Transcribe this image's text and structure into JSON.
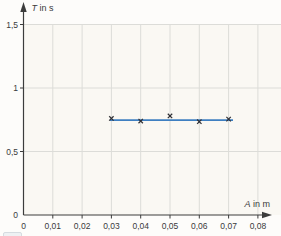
{
  "colors": {
    "background": "#fdfcfa",
    "plot_fill": "#faf8f3",
    "grid": "#dcdcd8",
    "axis": "#3c3c3c",
    "text": "#3a3a3a",
    "marker": "#2e2e33",
    "fit_line": "#3e7fc1",
    "corner_element_fill": "#eef1f3",
    "corner_element_border": "#d5dbe0"
  },
  "chart_data": {
    "type": "scatter",
    "title": "",
    "xlabel": "A in m",
    "ylabel": "T in s",
    "x_axis": {
      "symbol": "A",
      "unit_text": " in m",
      "tick_labels": [
        "0",
        "0,01",
        "0,02",
        "0,03",
        "0,04",
        "0,05",
        "0,06",
        "0,07",
        "0,08"
      ],
      "tick_values": [
        0,
        0.01,
        0.02,
        0.03,
        0.04,
        0.05,
        0.06,
        0.07,
        0.08
      ],
      "range": [
        0,
        0.088
      ],
      "decimal_separator": ","
    },
    "y_axis": {
      "symbol": "T",
      "unit_text": " in s",
      "tick_labels": [
        "0",
        "0,5",
        "1",
        "1,5"
      ],
      "tick_values": [
        0,
        0.5,
        1,
        1.5
      ],
      "range": [
        0,
        1.68
      ],
      "decimal_separator": ","
    },
    "grid": true,
    "marker": "x",
    "points": [
      {
        "x": 0.03,
        "y": 0.76
      },
      {
        "x": 0.04,
        "y": 0.74
      },
      {
        "x": 0.05,
        "y": 0.78
      },
      {
        "x": 0.06,
        "y": 0.735
      },
      {
        "x": 0.07,
        "y": 0.755
      }
    ],
    "fit_line": {
      "type": "horizontal",
      "y": 0.747,
      "x_start": 0.0295,
      "x_end": 0.0715
    },
    "legend": null
  },
  "extras": {
    "corner_element": "partially-visible-panel"
  }
}
